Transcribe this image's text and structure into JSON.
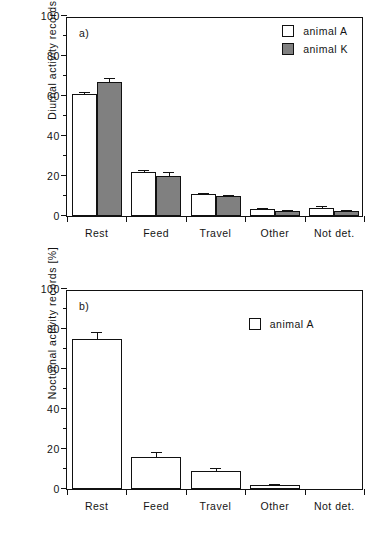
{
  "figure": {
    "background": "#ffffff",
    "axis_color": "#111111",
    "series_colors": {
      "animal_A": "#ffffff",
      "animal_K": "#808080"
    }
  },
  "panels": [
    {
      "tag": "a)",
      "ylabel": "Diurnal  activity  records  [%]",
      "legend": [
        {
          "label": "animal A",
          "swatch": "white-square-swatch"
        },
        {
          "label": "animal K",
          "swatch": "gray-square-swatch"
        }
      ]
    },
    {
      "tag": "b)",
      "ylabel": "Nocturnal  activity  records  [%]",
      "legend": [
        {
          "label": "animal A",
          "swatch": "white-square-swatch"
        }
      ]
    }
  ],
  "chart_data": [
    {
      "type": "bar",
      "panel": "a)",
      "title": "",
      "xlabel": "",
      "ylabel": "Diurnal  activity  records  [%]",
      "ylim": [
        0,
        100
      ],
      "yticks": [
        0,
        20,
        40,
        60,
        80,
        100
      ],
      "yticks_minor": [
        10,
        30,
        50,
        70,
        90
      ],
      "grid": false,
      "legend_position": "top-right",
      "categories": [
        "Rest",
        "Feed",
        "Travel",
        "Other",
        "Not det."
      ],
      "series": [
        {
          "name": "animal A",
          "color": "#ffffff",
          "values": [
            61,
            22,
            11,
            3.5,
            4
          ],
          "errors": [
            1,
            0.8,
            0.5,
            0.5,
            0.8
          ]
        },
        {
          "name": "animal K",
          "color": "#808080",
          "values": [
            67,
            20,
            10,
            2.5,
            2.5
          ],
          "errors": [
            2,
            2,
            0.5,
            0.4,
            0.4
          ]
        }
      ]
    },
    {
      "type": "bar",
      "panel": "b)",
      "title": "",
      "xlabel": "",
      "ylabel": "Nocturnal  activity  records  [%]",
      "ylim": [
        0,
        100
      ],
      "yticks": [
        0,
        20,
        40,
        60,
        80,
        100
      ],
      "yticks_minor": [
        10,
        30,
        50,
        70,
        90
      ],
      "grid": false,
      "legend_position": "top-right",
      "categories": [
        "Rest",
        "Feed",
        "Travel",
        "Other",
        "Not det."
      ],
      "series": [
        {
          "name": "animal A",
          "color": "#ffffff",
          "values": [
            75,
            16,
            9,
            2,
            0
          ],
          "errors": [
            3.5,
            2.5,
            1.5,
            0.5,
            0
          ]
        }
      ]
    }
  ]
}
